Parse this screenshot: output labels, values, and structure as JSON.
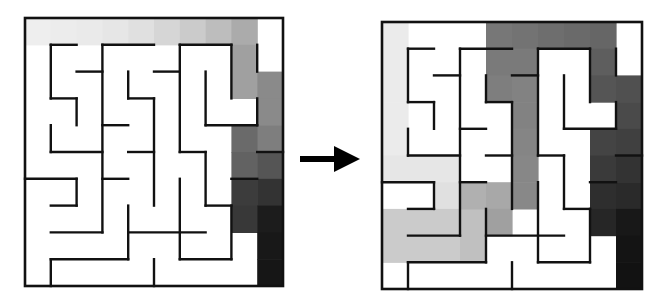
{
  "grid": {
    "cols": 10,
    "rows": 10
  },
  "walls": {
    "h": [
      [
        1,
        1,
        2
      ],
      [
        1,
        3,
        5
      ],
      [
        1,
        6,
        8
      ],
      [
        2,
        2,
        3
      ],
      [
        2,
        5,
        6
      ],
      [
        3,
        1,
        2
      ],
      [
        3,
        4,
        5
      ],
      [
        4,
        3,
        4
      ],
      [
        4,
        7,
        9
      ],
      [
        5,
        1,
        3
      ],
      [
        5,
        4,
        5
      ],
      [
        5,
        6,
        7
      ],
      [
        5,
        9,
        10
      ],
      [
        6,
        0,
        2
      ],
      [
        6,
        3,
        4
      ],
      [
        6,
        8,
        9
      ],
      [
        7,
        1,
        2
      ],
      [
        7,
        7,
        8
      ],
      [
        8,
        1,
        3
      ],
      [
        8,
        4,
        7
      ],
      [
        9,
        1,
        4
      ],
      [
        9,
        6,
        8
      ]
    ],
    "v": [
      [
        1,
        1,
        3
      ],
      [
        1,
        4,
        5
      ],
      [
        1,
        9,
        10
      ],
      [
        2,
        3,
        4
      ],
      [
        2,
        6,
        7
      ],
      [
        3,
        1,
        8
      ],
      [
        4,
        2,
        3
      ],
      [
        4,
        7,
        9
      ],
      [
        5,
        3,
        7
      ],
      [
        5,
        9,
        10
      ],
      [
        6,
        1,
        5
      ],
      [
        6,
        6,
        9
      ],
      [
        7,
        2,
        4
      ],
      [
        7,
        5,
        7
      ],
      [
        8,
        1,
        3
      ],
      [
        8,
        7,
        9
      ],
      [
        9,
        1,
        2
      ],
      [
        9,
        3,
        4
      ]
    ]
  },
  "mazes": [
    {
      "name": "maze-before",
      "x": 25,
      "y": 18,
      "w": 258,
      "h": 268,
      "cells": [
        [
          0,
          0,
          "#eeeeee"
        ],
        [
          1,
          0,
          "#ececec"
        ],
        [
          2,
          0,
          "#eaeaea"
        ],
        [
          3,
          0,
          "#e6e6e6"
        ],
        [
          4,
          0,
          "#e0e0e0"
        ],
        [
          5,
          0,
          "#d6d6d6"
        ],
        [
          6,
          0,
          "#cbcbcb"
        ],
        [
          7,
          0,
          "#bdbdbd"
        ],
        [
          8,
          0,
          "#ababab"
        ],
        [
          8,
          1,
          "#a0a0a0"
        ],
        [
          8,
          2,
          "#a0a0a0"
        ],
        [
          9,
          2,
          "#8a8a8a"
        ],
        [
          9,
          3,
          "#8a8a8a"
        ],
        [
          9,
          4,
          "#7e7e7e"
        ],
        [
          8,
          4,
          "#6a6a6a"
        ],
        [
          8,
          5,
          "#626262"
        ],
        [
          9,
          5,
          "#555555"
        ],
        [
          8,
          6,
          "#3c3c3c"
        ],
        [
          8,
          7,
          "#383838"
        ],
        [
          9,
          6,
          "#333333"
        ],
        [
          9,
          7,
          "#1c1c1c"
        ],
        [
          9,
          8,
          "#181818"
        ],
        [
          9,
          9,
          "#161616"
        ]
      ]
    },
    {
      "name": "maze-after",
      "x": 382,
      "y": 22,
      "w": 260,
      "h": 267,
      "cells": [
        [
          0,
          0,
          "#ebebeb"
        ],
        [
          0,
          1,
          "#ebebeb"
        ],
        [
          0,
          2,
          "#ebebeb"
        ],
        [
          0,
          3,
          "#ebebeb"
        ],
        [
          0,
          4,
          "#ebebeb"
        ],
        [
          0,
          5,
          "#e6e6e6"
        ],
        [
          1,
          5,
          "#e6e6e6"
        ],
        [
          2,
          5,
          "#e6e6e6"
        ],
        [
          2,
          6,
          "#e0e0e0"
        ],
        [
          0,
          7,
          "#cbcbcb"
        ],
        [
          1,
          7,
          "#cbcbcb"
        ],
        [
          2,
          7,
          "#cbcbcb"
        ],
        [
          3,
          7,
          "#c0c0c0"
        ],
        [
          0,
          8,
          "#cbcbcb"
        ],
        [
          1,
          8,
          "#cbcbcb"
        ],
        [
          2,
          8,
          "#cbcbcb"
        ],
        [
          3,
          8,
          "#c0c0c0"
        ],
        [
          3,
          6,
          "#b0b0b0"
        ],
        [
          4,
          6,
          "#a8a8a8"
        ],
        [
          4,
          7,
          "#a0a0a0"
        ],
        [
          4,
          0,
          "#777777"
        ],
        [
          5,
          0,
          "#737373"
        ],
        [
          6,
          0,
          "#6e6e6e"
        ],
        [
          7,
          0,
          "#6a6a6a"
        ],
        [
          8,
          0,
          "#666666"
        ],
        [
          4,
          1,
          "#7a7a7a"
        ],
        [
          5,
          1,
          "#7a7a7a"
        ],
        [
          4,
          2,
          "#7e7e7e"
        ],
        [
          5,
          2,
          "#828282"
        ],
        [
          5,
          3,
          "#828282"
        ],
        [
          5,
          4,
          "#858585"
        ],
        [
          5,
          5,
          "#878787"
        ],
        [
          5,
          6,
          "#888888"
        ],
        [
          8,
          1,
          "#5e5e5e"
        ],
        [
          8,
          2,
          "#555555"
        ],
        [
          9,
          2,
          "#505050"
        ],
        [
          9,
          3,
          "#4a4a4a"
        ],
        [
          8,
          4,
          "#444444"
        ],
        [
          9,
          4,
          "#404040"
        ],
        [
          8,
          5,
          "#3a3a3a"
        ],
        [
          9,
          5,
          "#333333"
        ],
        [
          8,
          6,
          "#2e2e2e"
        ],
        [
          9,
          6,
          "#2a2a2a"
        ],
        [
          8,
          7,
          "#262626"
        ],
        [
          9,
          7,
          "#181818"
        ],
        [
          9,
          8,
          "#141414"
        ],
        [
          9,
          9,
          "#121212"
        ]
      ]
    }
  ],
  "arrow": {
    "direction": "right",
    "color": "#000000"
  }
}
